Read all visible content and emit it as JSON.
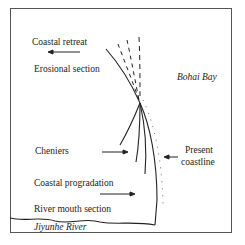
{
  "figure": {
    "labels": {
      "coastal_retreat": "Coastal retreat",
      "erosional_section": "Erosional section",
      "bohai_bay": "Bohai Bay",
      "cheniers": "Cheniers",
      "present_coastline_1": "Present",
      "present_coastline_2": "coastline",
      "coastal_progradation": "Coastal progradation",
      "river_mouth_section": "River mouth section",
      "jiyunhe_river": "Jiyunhe River"
    },
    "colors": {
      "line": "#222222",
      "frame": "#555555",
      "background": "#ffffff"
    }
  }
}
